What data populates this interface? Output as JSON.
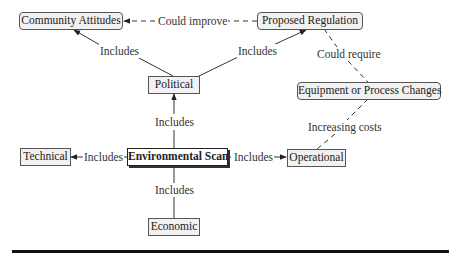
{
  "diagram": {
    "type": "concept-map",
    "nodes": {
      "community_attitudes": "Community Attitudes",
      "proposed_regulation": "Proposed Regulation",
      "political": "Political",
      "equipment_changes": "Equipment or Process Changes",
      "technical": "Technical",
      "environmental_scan": "Environmental Scan",
      "operational": "Operational",
      "economic": "Economic"
    },
    "edges": {
      "political_to_community": "Includes",
      "political_to_regulation": "Includes",
      "regulation_to_community": "Could improve",
      "regulation_to_equipment": "Could require",
      "scan_to_political": "Includes",
      "equipment_to_operational": "Increasing costs",
      "scan_to_technical": "Includes",
      "scan_to_operational": "Includes",
      "scan_to_economic": "Includes"
    },
    "colors": {
      "node_fill": "#f1f1f1",
      "border": "#555555",
      "line": "#333333",
      "rule": "#111111"
    }
  }
}
